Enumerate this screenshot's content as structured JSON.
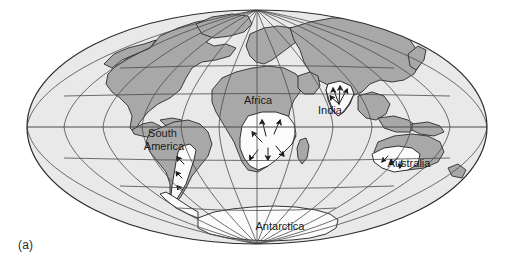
{
  "figure": {
    "caption_label": "(a)",
    "projection": "mollweide-ellipse",
    "colors": {
      "background": "#ffffff",
      "ocean": "#e9e9e9",
      "land": "#a8a8a8",
      "glaciated": "#fbfbfb",
      "graticule": "#4a4a4a",
      "outline": "#2b2b2b",
      "label_text": "#1a1a1a"
    },
    "graticule": {
      "meridian_spacing_deg": 30,
      "parallel_spacing_deg": 30,
      "visible": true
    }
  },
  "continent_labels": [
    {
      "name": "Africa",
      "text": "Africa",
      "x": 258,
      "y": 100,
      "lines": [
        "Africa"
      ]
    },
    {
      "name": "India",
      "text": "India",
      "x": 330,
      "y": 110,
      "lines": [
        "India"
      ]
    },
    {
      "name": "South America",
      "text": "South America",
      "x": 162,
      "y": 136,
      "lines": [
        "South",
        "America"
      ]
    },
    {
      "name": "Australia",
      "text": "Australia",
      "x": 407,
      "y": 164,
      "lines": [
        "Australia"
      ]
    },
    {
      "name": "Antarctica",
      "text": "Antarctica",
      "x": 280,
      "y": 229,
      "lines": [
        "Antarctica"
      ]
    }
  ],
  "glaciated_regions": [
    {
      "name": "southern-africa",
      "label": "Africa",
      "has_flow_arrows": true
    },
    {
      "name": "india-peninsula",
      "label": "India",
      "has_flow_arrows": true
    },
    {
      "name": "southern-south-america",
      "label": "South America",
      "has_flow_arrows": true
    },
    {
      "name": "southern-australia",
      "label": "Australia",
      "has_flow_arrows": true
    },
    {
      "name": "antarctica",
      "label": "Antarctica",
      "has_flow_arrows": false
    }
  ]
}
